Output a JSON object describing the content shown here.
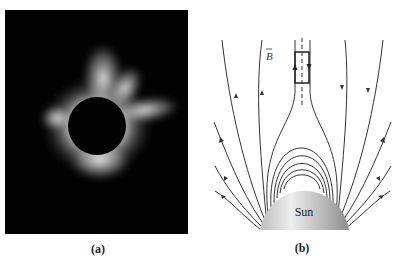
{
  "figure": {
    "panels": [
      {
        "id": "a",
        "caption": "(a)",
        "description": "Photograph of solar corona during total eclipse: dark lunar disk surrounded by bright white coronal streamers on black background"
      },
      {
        "id": "b",
        "caption": "(b)",
        "description": "Magnetic field lines above the Sun: closed loops near surface, open field lines extending outward, helmet streamer with rectangular loop straddling dashed current sheet",
        "labels": {
          "field": "B",
          "body": "Sun"
        },
        "elements": {
          "closed_loops": 5,
          "open_field_lines_per_side": 5,
          "rectangular_loop_arrows": [
            "up (left side)",
            "down (right side)"
          ],
          "current_sheet": "dashed vertical line"
        }
      }
    ]
  },
  "colors": {
    "background": "#ffffff",
    "photo_background": "#020202",
    "corona": "#e8e8e8",
    "field_line": "#333333",
    "sun_fill_light": "#e6e6e6",
    "sun_fill_dark": "#9a9a9a"
  }
}
